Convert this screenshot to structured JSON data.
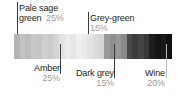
{
  "bar": {
    "name": "palette-proportion-bar",
    "stripe_colors": [
      "#b3b3b3",
      "#c2c2c2",
      "#bdbdbd",
      "#c8c8c8",
      "#c5c5c5",
      "#cfcfcf",
      "#cacaca",
      "#d4d4d4",
      "#e2e2e2",
      "#ececec",
      "#e6e6e6",
      "#f0f0f0",
      "#ebebeb",
      "#e3e3e3",
      "#dcdcdc",
      "#d6d6d6",
      "#9a9a9a",
      "#8e8e8e",
      "#989898",
      "#8a8a8a",
      "#4a4a4a",
      "#3c3c3c",
      "#454545",
      "#383838",
      "#1e1e1e",
      "#141414",
      "#191919",
      "#101010"
    ]
  },
  "annotations": [
    {
      "id": "pale-sage-green",
      "name_line1": "Pale sage",
      "name_line2": "green",
      "percent": "25%",
      "swatch_hex": "#bfc6ae",
      "leader": {
        "x": 17,
        "top": 2,
        "height": 32,
        "tone": "dark"
      }
    },
    {
      "id": "grey-green",
      "name_line1": "Grey-green",
      "name_line2": "",
      "percent": "15%",
      "swatch_hex": "#8f978c",
      "leader": {
        "x": 88,
        "top": 12,
        "height": 22,
        "tone": "dark"
      }
    },
    {
      "id": "amber",
      "name_line1": "Amber",
      "name_line2": "",
      "percent": "25%",
      "swatch_hex": "#e8b84b",
      "leader": {
        "x": 60,
        "top": 44,
        "height": 30,
        "tone": "dark"
      }
    },
    {
      "id": "dark-grey",
      "name_line1": "Dark grey",
      "name_line2": "",
      "percent": "15%",
      "swatch_hex": "#4a4a4a",
      "leader": {
        "x": 114,
        "top": 44,
        "height": 34,
        "tone": "dark"
      }
    },
    {
      "id": "wine",
      "name_line1": "Wine",
      "name_line2": "",
      "percent": "20%",
      "swatch_hex": "#5b1f2a",
      "leader": {
        "x": 166,
        "top": 44,
        "height": 34,
        "tone": "light"
      }
    }
  ],
  "chart_data": {
    "type": "bar",
    "orientation": "horizontal-stacked",
    "categories": [
      "Pale sage green",
      "Amber",
      "Grey-green",
      "Dark grey",
      "Wine"
    ],
    "values": [
      25,
      25,
      15,
      15,
      20
    ],
    "unit": "%",
    "labels": [
      "25%",
      "25%",
      "15%",
      "15%",
      "20%"
    ],
    "colors": [
      "#bfc6ae",
      "#e8b84b",
      "#8f978c",
      "#4a4a4a",
      "#5b1f2a"
    ],
    "xlabel": "",
    "ylabel": "",
    "grid": false,
    "legend": "none"
  }
}
